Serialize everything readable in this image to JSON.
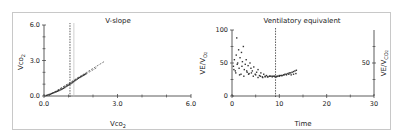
{
  "chart_data": [
    {
      "type": "scatter",
      "title": "V-slope",
      "xlabel": "Vco2",
      "ylabel": "Vco2",
      "xlabel_main": "Vco",
      "xlabel_sub": "2",
      "ylabel_main": "Vco",
      "ylabel_sub": "2",
      "xlim": [
        0,
        6
      ],
      "ylim": [
        0,
        6
      ],
      "x_ticks": [
        0.0,
        3.0,
        6.0
      ],
      "x_tick_labels": [
        "0.0",
        "3.0",
        "6.0"
      ],
      "x_minor_ticks": [
        1,
        2,
        4,
        5
      ],
      "y_ticks": [
        0.0,
        3.0,
        6.0
      ],
      "y_tick_labels": [
        "0.0",
        "3.0",
        "6.0"
      ],
      "y_minor_ticks": [
        1,
        2,
        4,
        5
      ],
      "grid": false,
      "vertical_lines": [
        {
          "x": 1.06,
          "style": "dashed",
          "color": "#333333"
        },
        {
          "x": 1.22,
          "style": "solid",
          "color": "#bbbbbb"
        }
      ],
      "regression_lines": [
        {
          "x": [
            0.2,
            2.45
          ],
          "y": [
            0.05,
            2.9
          ],
          "style": "dashed"
        },
        {
          "x": [
            0.2,
            2.16
          ],
          "y": [
            0.05,
            2.4
          ],
          "style": "dashed"
        }
      ],
      "series": [
        {
          "name": "data",
          "x": [
            0.1,
            0.15,
            0.2,
            0.25,
            0.3,
            0.35,
            0.4,
            0.45,
            0.5,
            0.55,
            0.6,
            0.65,
            0.7,
            0.75,
            0.8,
            0.85,
            0.9,
            0.95,
            1.0,
            1.05,
            1.1,
            1.15,
            1.2,
            1.25,
            1.3,
            1.35,
            1.4,
            1.45,
            1.5,
            1.55,
            1.6,
            1.65,
            1.7
          ],
          "y": [
            0.05,
            0.08,
            0.12,
            0.15,
            0.2,
            0.24,
            0.28,
            0.32,
            0.36,
            0.4,
            0.45,
            0.5,
            0.55,
            0.6,
            0.65,
            0.72,
            0.8,
            0.86,
            0.92,
            0.98,
            1.05,
            1.12,
            1.2,
            1.28,
            1.35,
            1.42,
            1.5,
            1.56,
            1.62,
            1.68,
            1.74,
            1.8,
            1.86
          ]
        }
      ]
    },
    {
      "type": "scatter",
      "title": "Ventilatory equivalent",
      "xlabel": "Time",
      "ylabel": "VE/VO2",
      "ylabel_right": "VE/VCO2",
      "ylabel_main": "VE/V",
      "ylabel_sub_o": "O",
      "ylabel_sub": "2",
      "ylabel_right_main": "VE/V",
      "ylabel_right_sub_o": "CO",
      "ylabel_right_sub": "2",
      "xlim": [
        0,
        30
      ],
      "ylim": [
        0,
        100
      ],
      "ylim_right": [
        0,
        100
      ],
      "x_ticks": [
        0,
        10,
        20,
        30
      ],
      "x_tick_labels": [
        "0",
        "10",
        "20",
        "30"
      ],
      "x_minor_ticks": [
        5,
        15,
        25
      ],
      "y_ticks": [
        0,
        50,
        100
      ],
      "y_tick_labels": [
        "0",
        "50",
        "100"
      ],
      "y_minor_ticks": [
        25,
        75
      ],
      "y_right_ticks": [
        50
      ],
      "y_right_tick_labels": [
        "50"
      ],
      "y_right_minor_ticks": [
        25,
        75
      ],
      "grid": false,
      "vertical_lines": [
        {
          "x": 9.2,
          "style": "dashed",
          "color": "#333333"
        }
      ],
      "series": [
        {
          "name": "VE/VO2",
          "x": [
            0.3,
            0.5,
            0.7,
            0.9,
            1.0,
            1.2,
            1.4,
            1.5,
            1.7,
            1.9,
            2.0,
            2.2,
            2.4,
            2.6,
            2.8,
            3.0,
            3.2,
            3.4,
            3.6,
            3.8,
            4.0,
            4.3,
            4.6,
            4.9,
            5.2,
            5.5,
            5.8,
            6.1,
            6.4,
            6.7,
            7.0,
            7.3,
            7.6,
            7.9,
            8.2,
            8.5,
            8.8,
            9.1,
            9.4,
            9.7,
            10.0,
            10.3,
            10.6,
            10.9,
            11.2,
            11.5,
            11.8,
            12.1,
            12.4,
            12.7,
            13.0,
            13.3,
            13.6
          ],
          "y": [
            45,
            55,
            38,
            62,
            88,
            50,
            70,
            42,
            58,
            33,
            66,
            52,
            75,
            40,
            48,
            55,
            36,
            46,
            34,
            50,
            42,
            38,
            44,
            33,
            36,
            40,
            31,
            35,
            29,
            33,
            30,
            31,
            29,
            30,
            30,
            29,
            30,
            29,
            29,
            30,
            30,
            31,
            31,
            32,
            33,
            33,
            34,
            35,
            35,
            36,
            37,
            38,
            39
          ]
        },
        {
          "name": "VE/VCO2",
          "x": [
            0.4,
            0.8,
            1.1,
            1.6,
            2.1,
            2.5,
            3.1,
            3.5,
            4.1,
            4.5,
            5.0,
            5.5,
            6.0,
            6.5,
            7.0,
            7.5,
            8.0,
            8.5,
            9.0,
            9.5,
            10.0,
            10.5,
            11.0,
            11.5,
            12.0,
            12.5,
            13.0,
            13.5
          ],
          "y": [
            40,
            35,
            48,
            32,
            45,
            30,
            38,
            33,
            35,
            30,
            32,
            28,
            30,
            28,
            29,
            29,
            30,
            30,
            30,
            30,
            31,
            31,
            32,
            32,
            33,
            32,
            33,
            34
          ]
        }
      ]
    }
  ]
}
